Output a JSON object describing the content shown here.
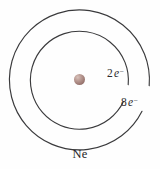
{
  "figure": {
    "kind": "bohr-atomic-shell-diagram",
    "element_symbol": "Ne",
    "element_symbol_label": "Ne",
    "background_color": "#fefefe",
    "shell_stroke_color": "#3a3a3c"
  },
  "nucleus": {
    "name": "nucleus",
    "center_x": 79.5,
    "center_y": 79.5,
    "diameter": 11,
    "color": "#9d7a74",
    "highlight_color": "#d8c2bb"
  },
  "shells": [
    {
      "name": "inner-shell",
      "order": 1,
      "electron_count": "2",
      "label_number": "2",
      "label_electron": "e",
      "label_charge": "−",
      "label_full": "2 e−",
      "center_x": 79.5,
      "center_y": 79.5,
      "radius": 49,
      "gap_start_deg": -26,
      "gap_end_deg": 6
    },
    {
      "name": "outer-shell",
      "order": 2,
      "electron_count": "8",
      "label_number": "8",
      "label_electron": "e",
      "label_charge": "−",
      "label_full": "8 e−",
      "center_x": 79.5,
      "center_y": 79.5,
      "radius": 70,
      "gap_start_deg": -5,
      "gap_end_deg": 27
    }
  ],
  "paths": {
    "inner_shell_arc": "M 123.5 101.6 A 49 49 0 1 1 128.2 84.6",
    "outer_shell_arc": "M 142.0 111.3 A 70 70 0 1 1 149.2 85.6"
  }
}
